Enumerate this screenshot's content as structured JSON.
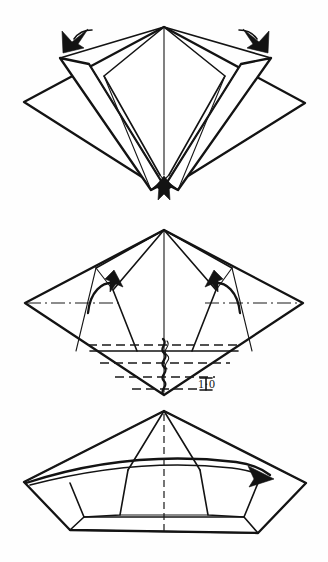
{
  "document": {
    "kind": "origami-folding-instructions",
    "page_background": "#ffffff",
    "ink_color": "#111111",
    "width": 328,
    "height": 562
  },
  "labels": {
    "step_marker": {
      "beam_symbol": "I",
      "number_text": "1·0",
      "full_text": "I 1·0"
    }
  },
  "figures": [
    {
      "id": "figure-1",
      "name": "squash-fold-step",
      "caption": "",
      "apex": [
        164,
        27
      ],
      "left_vertex": [
        24,
        102
      ],
      "right_vertex": [
        305,
        103
      ],
      "bottom_vertex": [
        164,
        191
      ],
      "arrows": [
        {
          "name": "arrow-petal-left",
          "direction": "down-left",
          "tip": [
            77,
            38
          ]
        },
        {
          "name": "arrow-petal-right",
          "direction": "down-right",
          "tip": [
            256,
            38
          ]
        },
        {
          "name": "arrow-bottom-center",
          "direction": "down",
          "tip": [
            164,
            193
          ]
        }
      ]
    },
    {
      "id": "figure-2",
      "name": "pleat-and-fold-step",
      "caption": "I 1·0",
      "apex": [
        164,
        230
      ],
      "left_vertex": [
        25,
        303
      ],
      "right_vertex": [
        303,
        303
      ],
      "bottom_vertex": [
        164,
        395
      ],
      "arrows": [
        {
          "name": "arrow-curved-left",
          "direction": "curl-clockwise"
        },
        {
          "name": "arrow-curved-right",
          "direction": "curl-clockwise"
        }
      ],
      "guides": {
        "dash_dot_horizontal": true,
        "dashed_pleat_lines": 4,
        "pleat_symbol": "accordion-zigzag"
      }
    },
    {
      "id": "figure-3",
      "name": "completed-form-step",
      "caption": "",
      "apex": [
        164,
        411
      ],
      "left_vertex": [
        24,
        482
      ],
      "right_vertex": [
        306,
        483
      ],
      "base_left": [
        70,
        530
      ],
      "base_right": [
        258,
        533
      ],
      "arrows": [
        {
          "name": "arrow-band-right",
          "direction": "right",
          "tip": [
            268,
            478
          ]
        }
      ],
      "guides": {
        "dashed_center_line": true,
        "curved_rim_band": true
      }
    }
  ]
}
